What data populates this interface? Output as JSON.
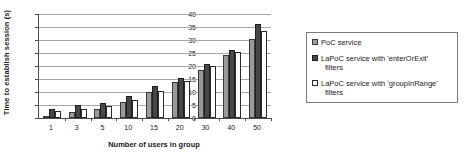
{
  "chart_data": {
    "type": "bar",
    "title": "",
    "xlabel": "Number of users in group",
    "ylabel": "Time to establish session (s)",
    "categories": [
      "1",
      "3",
      "5",
      "10",
      "15",
      "20",
      "30",
      "40",
      "50"
    ],
    "ylim": [
      0,
      40
    ],
    "yticks": [
      0,
      5,
      10,
      15,
      20,
      25,
      30,
      35,
      40
    ],
    "grid": true,
    "legend_position": "right",
    "series": [
      {
        "name": "PoC service",
        "color": "#9a9a9a",
        "values": [
          0.8,
          2.4,
          3.5,
          6.3,
          10.1,
          13.9,
          18.4,
          24.2,
          30.5
        ]
      },
      {
        "name": "LaPoC service with 'enterOrExit' filters",
        "color": "#474747",
        "values": [
          3.3,
          4.9,
          5.6,
          8.5,
          12.3,
          15.3,
          20.8,
          26.2,
          36.2
        ]
      },
      {
        "name": "LaPoC service with 'groupInRange' filters",
        "color": "#ffffff",
        "values": [
          2.6,
          3.5,
          4.6,
          7.1,
          10.3,
          14.4,
          20.0,
          25.5,
          33.5
        ]
      }
    ]
  },
  "legend": {
    "items": [
      {
        "label": "PoC service",
        "label_line2": ""
      },
      {
        "label": "LaPoC service with 'enterOrExit'",
        "label_line2": "filters"
      },
      {
        "label": "LaPoC service with 'groupInRange'",
        "label_line2": "filters"
      }
    ]
  }
}
